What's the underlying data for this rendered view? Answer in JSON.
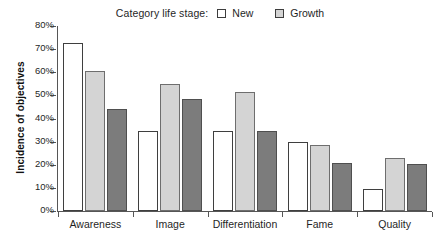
{
  "chart_data": {
    "type": "bar",
    "title": "",
    "xlabel": "",
    "ylabel": "Incidence of objectives",
    "ylim": [
      0,
      80
    ],
    "ytick_labels": [
      "0%",
      "10%",
      "20%",
      "30%",
      "40%",
      "50%",
      "60%",
      "70%",
      "80%"
    ],
    "ytick_values": [
      0,
      10,
      20,
      30,
      40,
      50,
      60,
      70,
      80
    ],
    "grid": false,
    "legend_position": "top-center",
    "categories": [
      "Awareness",
      "Image",
      "Differentiation",
      "Fame",
      "Quality"
    ],
    "series": [
      {
        "name": "New",
        "color": "#ffffff",
        "values": [
          72.5,
          34.8,
          34.8,
          30.0,
          9.6
        ]
      },
      {
        "name": "Growth",
        "color": "#d4d4d4",
        "values": [
          60.5,
          55.0,
          51.4,
          28.6,
          23.1
        ]
      },
      {
        "name": "",
        "color": "#7c7c7c",
        "values": [
          44.1,
          48.4,
          34.5,
          20.6,
          20.2
        ]
      }
    ]
  },
  "legend": {
    "title": "Category life stage:",
    "entries": [
      {
        "label": "New",
        "color": "#ffffff"
      },
      {
        "label": "Growth",
        "color": "#d4d4d4"
      }
    ]
  },
  "axes": {
    "y_title": "Incidence of objectives"
  }
}
